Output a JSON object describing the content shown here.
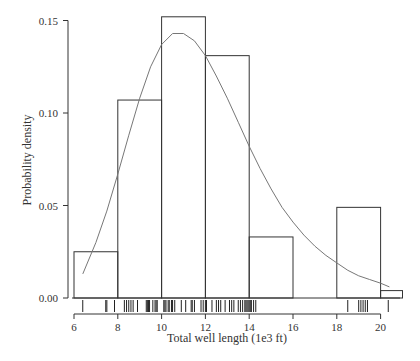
{
  "chart_data": {
    "type": "bar",
    "subtype": "histogram_with_density_curve_and_rug",
    "title": "",
    "xlabel": "Total well length (1e3 ft)",
    "ylabel": "Probability density",
    "xlim": [
      6,
      21
    ],
    "ylim": [
      0,
      0.155
    ],
    "x_ticks": [
      6,
      8,
      10,
      12,
      14,
      16,
      18,
      20
    ],
    "x_tick_labels": [
      "6",
      "8",
      "10",
      "12",
      "14",
      "16",
      "18",
      "20"
    ],
    "y_ticks": [
      0.0,
      0.05,
      0.1,
      0.15
    ],
    "y_tick_labels": [
      "0.00",
      "0.05",
      "0.10",
      "0.15"
    ],
    "grid": false,
    "legend": null,
    "bins": [
      {
        "x0": 6,
        "x1": 8,
        "density": 0.025
      },
      {
        "x0": 8,
        "x1": 10,
        "density": 0.107
      },
      {
        "x0": 10,
        "x1": 12,
        "density": 0.152
      },
      {
        "x0": 12,
        "x1": 14,
        "density": 0.131
      },
      {
        "x0": 14,
        "x1": 16,
        "density": 0.033
      },
      {
        "x0": 16,
        "x1": 18,
        "density": 0.0
      },
      {
        "x0": 18,
        "x1": 20,
        "density": 0.049
      },
      {
        "x0": 20,
        "x1": 21,
        "density": 0.004
      }
    ],
    "categories": [
      "6-8",
      "8-10",
      "10-12",
      "12-14",
      "14-16",
      "16-18",
      "18-20",
      "20-21"
    ],
    "values": [
      0.025,
      0.107,
      0.152,
      0.131,
      0.033,
      0.0,
      0.049,
      0.004
    ],
    "density_curve": {
      "name": "fitted density",
      "x": [
        6.4,
        7.0,
        7.5,
        8.0,
        8.5,
        9.0,
        9.5,
        10.0,
        10.5,
        11.0,
        11.5,
        12.0,
        12.5,
        13.0,
        13.5,
        14.0,
        14.5,
        15.0,
        15.5,
        16.0,
        16.5,
        17.0,
        17.5,
        18.0,
        18.5,
        19.0,
        19.5,
        20.0,
        20.4
      ],
      "y": [
        0.013,
        0.03,
        0.047,
        0.067,
        0.088,
        0.108,
        0.125,
        0.137,
        0.143,
        0.143,
        0.139,
        0.131,
        0.12,
        0.108,
        0.095,
        0.082,
        0.07,
        0.059,
        0.049,
        0.041,
        0.034,
        0.028,
        0.023,
        0.019,
        0.015,
        0.012,
        0.01,
        0.008,
        0.006
      ]
    },
    "rug": [
      6.4,
      7.45,
      7.5,
      7.85,
      8.3,
      8.4,
      8.5,
      8.6,
      8.7,
      8.9,
      9.3,
      9.35,
      9.4,
      9.45,
      9.6,
      9.7,
      9.75,
      9.8,
      10.1,
      10.15,
      10.2,
      10.3,
      10.35,
      10.45,
      10.5,
      10.6,
      10.9,
      11.1,
      11.35,
      11.4,
      11.5,
      11.8,
      11.9,
      12.0,
      12.05,
      12.3,
      12.5,
      12.6,
      12.7,
      12.9,
      13.1,
      13.2,
      13.3,
      13.5,
      13.6,
      13.7,
      13.8,
      13.85,
      13.9,
      13.95,
      14.0,
      14.05,
      14.1,
      14.2,
      14.3,
      18.5,
      19.0,
      19.1,
      19.2,
      19.3,
      19.4,
      20.35
    ],
    "colors": {
      "bar_stroke": "#333333",
      "bar_fill": "none",
      "curve": "#777777",
      "axis": "#333333",
      "rug": "#222222"
    }
  }
}
